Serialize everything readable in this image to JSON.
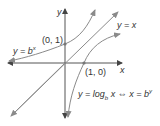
{
  "diagram": {
    "colors": {
      "axis": "#555555",
      "curve": "#8a8a8a",
      "text": "#333333",
      "point": "#777777"
    },
    "axes": {
      "x_label": "x",
      "y_label": "y"
    },
    "curves": [
      {
        "name": "exponential",
        "label_prefix": "y = b",
        "label_exponent": "x"
      },
      {
        "name": "identity",
        "label": "y = x"
      },
      {
        "name": "logarithm",
        "label_prefix": "y = log",
        "label_sub": "b",
        "label_mid": " x ⇔ x = b",
        "label_exponent": "y"
      }
    ],
    "points": [
      {
        "label": "(0, 1)"
      },
      {
        "label": "(1, 0)"
      }
    ]
  }
}
